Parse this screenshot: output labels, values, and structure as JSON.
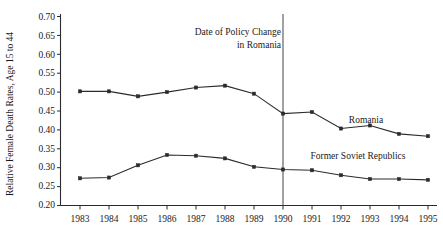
{
  "chart_data": {
    "type": "line",
    "title": "",
    "xlabel": "",
    "ylabel": "Relative Female Death Rates, Age 15 to 44",
    "x": [
      1983,
      1984,
      1985,
      1986,
      1987,
      1988,
      1989,
      1990,
      1991,
      1992,
      1993,
      1994,
      1995
    ],
    "xtick_labels": [
      "1983",
      "1984",
      "1985",
      "1986",
      "1987",
      "1988",
      "1989",
      "1990",
      "1991",
      "1992",
      "1993",
      "1994",
      "1995"
    ],
    "ytick_labels": [
      "0.70",
      "0.65",
      "0.60",
      "0.55",
      "0.50",
      "0.45",
      "0.40",
      "0.35",
      "0.30",
      "0.25",
      "0.20"
    ],
    "ytick_values": [
      0.7,
      0.65,
      0.6,
      0.55,
      0.5,
      0.45,
      0.4,
      0.35,
      0.3,
      0.25,
      0.2
    ],
    "ylim": [
      0.2,
      0.7
    ],
    "xlim": [
      1983,
      1995
    ],
    "grid": false,
    "legend_position": "inline-right",
    "series": [
      {
        "name": "Romania",
        "label": "Romania",
        "color": "#2b2b2b",
        "marker": "square",
        "values": [
          0.498,
          0.498,
          0.485,
          0.496,
          0.508,
          0.513,
          0.492,
          0.44,
          0.444,
          0.401,
          0.409,
          0.387,
          0.381
        ]
      },
      {
        "name": "Former Soviet Republics",
        "label": "Former Soviet Republics",
        "color": "#2b2b2b",
        "marker": "square",
        "values": [
          0.271,
          0.273,
          0.305,
          0.332,
          0.33,
          0.323,
          0.301,
          0.294,
          0.292,
          0.279,
          0.269,
          0.269,
          0.267
        ]
      }
    ],
    "annotations": [
      {
        "name": "policy-change-annotation",
        "line1": "Date of Policy Change",
        "line2": "in Romania",
        "vline_x": 1990
      }
    ]
  }
}
